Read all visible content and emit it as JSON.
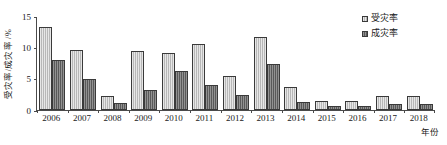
{
  "chart_data": {
    "type": "bar",
    "title": "",
    "xlabel": "年份",
    "ylabel": "受灾率/成灾率 /%",
    "categories": [
      "2006",
      "2007",
      "2008",
      "2009",
      "2010",
      "2011",
      "2012",
      "2013",
      "2014",
      "2015",
      "2016",
      "2017",
      "2018"
    ],
    "series": [
      {
        "name": "受灾率",
        "color": "#c9c9c9",
        "values": [
          13.3,
          9.5,
          2.2,
          9.4,
          9.1,
          10.5,
          5.4,
          11.6,
          3.6,
          1.5,
          1.4,
          2.2,
          2.2
        ]
      },
      {
        "name": "成灾率",
        "color": "#6e6e6e",
        "values": [
          8.0,
          4.9,
          1.1,
          3.2,
          6.3,
          4.0,
          2.4,
          7.3,
          1.2,
          0.7,
          0.7,
          1.0,
          1.0
        ]
      }
    ],
    "ylim": [
      0,
      15
    ],
    "yticks": [
      0,
      5,
      10,
      15
    ],
    "ytick_labels": [
      "0",
      "5",
      "10",
      "15"
    ],
    "grid": false,
    "legend_position": "top-right"
  },
  "legend": {
    "items": [
      {
        "label": "受灾率",
        "swatch": "light"
      },
      {
        "label": "成灾率",
        "swatch": "dark"
      }
    ]
  },
  "axes": {
    "y_title": "受灾率/成灾率 /%",
    "x_title": "年份"
  }
}
